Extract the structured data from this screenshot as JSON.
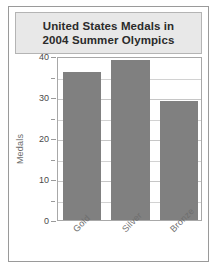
{
  "chart_data": {
    "type": "bar",
    "title": "United States Medals in 2004 Summer Olympics",
    "title_lines": [
      "United States Medals in",
      "2004 Summer Olympics"
    ],
    "categories": [
      "Gold",
      "Silver",
      "Bronze"
    ],
    "values": [
      36,
      39,
      29
    ],
    "xlabel": "",
    "ylabel": "Medals",
    "ylim": [
      0,
      40
    ],
    "ytick_labels": [
      "0",
      "10",
      "20",
      "30",
      "40"
    ],
    "ytick_values": [
      0,
      10,
      20,
      30,
      40
    ],
    "minor_tick_values": [
      5,
      15,
      25,
      35
    ],
    "grid": true,
    "legend": false,
    "bar_color": "#808080",
    "plot_background": "#ffffff",
    "title_background": "#e8e8e8",
    "frame_color": "#9a9a9a"
  }
}
